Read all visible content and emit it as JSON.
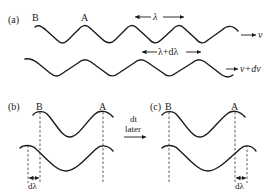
{
  "diagram": {
    "panel_a": {
      "label": "(a)",
      "crest_labels": [
        "B",
        "A"
      ],
      "wave1_wavelength_label": "λ",
      "wave1_speed_label": "v",
      "wave2_wavelength_label": "λ+dλ",
      "wave2_speed_label": "v+dv"
    },
    "panel_b": {
      "label": "(b)",
      "crest_labels": [
        "B",
        "A"
      ],
      "offset_label": "dλ"
    },
    "transition": {
      "line1": "dt",
      "line2": "later"
    },
    "panel_c": {
      "label": "(c)",
      "crest_labels": [
        "B",
        "A"
      ],
      "offset_label": "dλ"
    },
    "colors": {
      "ink": "#1a1a1a",
      "background": "#ffffff"
    }
  }
}
